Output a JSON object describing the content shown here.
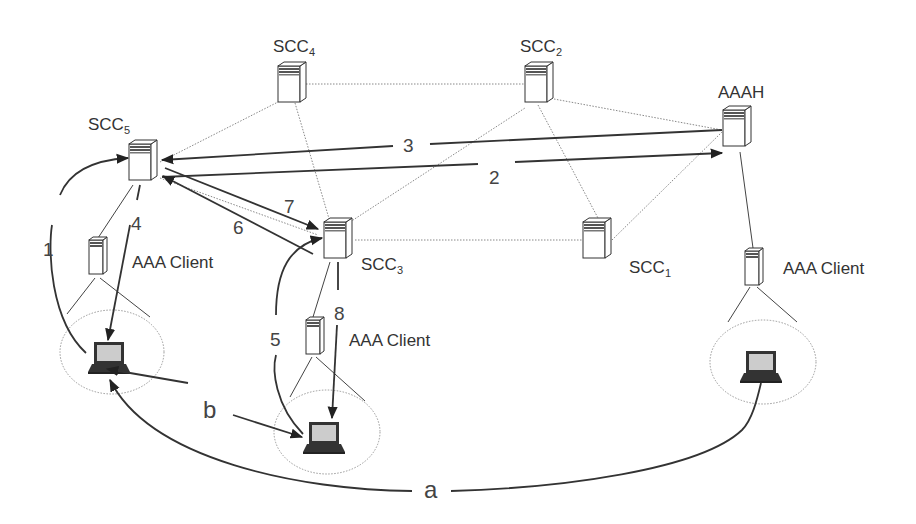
{
  "nodes": {
    "scc5": {
      "name": "SCC",
      "sub": "5"
    },
    "scc4": {
      "name": "SCC",
      "sub": "4"
    },
    "scc2": {
      "name": "SCC",
      "sub": "2"
    },
    "scc3": {
      "name": "SCC",
      "sub": "3"
    },
    "scc1": {
      "name": "SCC",
      "sub": "1"
    },
    "aaah": {
      "name": "AAAH"
    },
    "client_left": {
      "name": "AAA Client"
    },
    "client_mid": {
      "name": "AAA Client"
    },
    "client_right": {
      "name": "AAA Client"
    }
  },
  "steps": {
    "s1": "1",
    "s2": "2",
    "s3": "3",
    "s4": "4",
    "s5": "5",
    "s6": "6",
    "s7": "7",
    "s8": "8",
    "a": "a",
    "b": "b"
  },
  "icons": {
    "server": "server-tower-icon",
    "laptop": "laptop-icon"
  },
  "colors": {
    "line": "#333333",
    "dotted": "#888888",
    "background": "#ffffff"
  }
}
